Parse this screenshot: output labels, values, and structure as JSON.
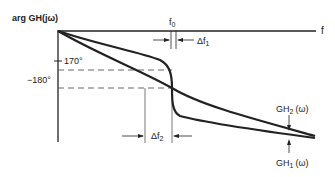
{
  "diagram": {
    "ylabel": "arg GH(jω)",
    "xlabel": "f",
    "tick_170": "170°",
    "tick_180": "−180°",
    "f0_label": "f",
    "f0_sub": "0",
    "df1_label": "Δf",
    "df1_sub": "1",
    "df2_label": "Δf",
    "df2_sub": "2",
    "gh2_label": "GH",
    "gh2_sub": "2",
    "gh2_arg": "(ω)",
    "gh1_label": "GH",
    "gh1_sub": "1",
    "gh1_arg": "(ω)"
  },
  "colors": {
    "ink": "#222222",
    "dashed": "#555555"
  }
}
